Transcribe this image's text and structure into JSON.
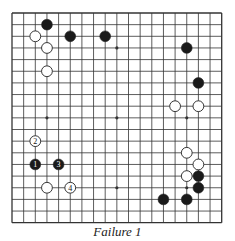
{
  "diagram": {
    "type": "go-board",
    "size": 19,
    "caption": "Failure 1",
    "colors": {
      "line": "#333333",
      "black_stone": "#1a1a1a",
      "white_stone": "#ffffff",
      "stone_outline": "#222222",
      "background": "#ffffff"
    },
    "hoshi": [
      [
        3,
        3
      ],
      [
        9,
        3
      ],
      [
        15,
        3
      ],
      [
        3,
        9
      ],
      [
        9,
        9
      ],
      [
        15,
        9
      ],
      [
        3,
        15
      ],
      [
        9,
        15
      ],
      [
        15,
        15
      ]
    ],
    "stones": [
      {
        "color": "black",
        "col": 3,
        "row": 1,
        "label": ""
      },
      {
        "color": "white",
        "col": 2,
        "row": 2,
        "label": ""
      },
      {
        "color": "black",
        "col": 5,
        "row": 2,
        "label": ""
      },
      {
        "color": "black",
        "col": 8,
        "row": 2,
        "label": ""
      },
      {
        "color": "white",
        "col": 3,
        "row": 3,
        "label": ""
      },
      {
        "color": "white",
        "col": 3,
        "row": 5,
        "label": ""
      },
      {
        "color": "black",
        "col": 15,
        "row": 3,
        "label": ""
      },
      {
        "color": "black",
        "col": 16,
        "row": 6,
        "label": ""
      },
      {
        "color": "white",
        "col": 14,
        "row": 8,
        "label": ""
      },
      {
        "color": "white",
        "col": 16,
        "row": 8,
        "label": ""
      },
      {
        "color": "white",
        "col": 2,
        "row": 11,
        "label": "2"
      },
      {
        "color": "black",
        "col": 2,
        "row": 13,
        "label": "1"
      },
      {
        "color": "black",
        "col": 4,
        "row": 13,
        "label": "3"
      },
      {
        "color": "white",
        "col": 3,
        "row": 15,
        "label": ""
      },
      {
        "color": "white",
        "col": 5,
        "row": 15,
        "label": "4"
      },
      {
        "color": "white",
        "col": 15,
        "row": 12,
        "label": ""
      },
      {
        "color": "white",
        "col": 16,
        "row": 13,
        "label": ""
      },
      {
        "color": "white",
        "col": 15,
        "row": 14,
        "label": ""
      },
      {
        "color": "black",
        "col": 16,
        "row": 14,
        "label": ""
      },
      {
        "color": "black",
        "col": 16,
        "row": 15,
        "label": ""
      },
      {
        "color": "black",
        "col": 13,
        "row": 16,
        "label": ""
      },
      {
        "color": "black",
        "col": 15,
        "row": 16,
        "label": ""
      }
    ]
  }
}
